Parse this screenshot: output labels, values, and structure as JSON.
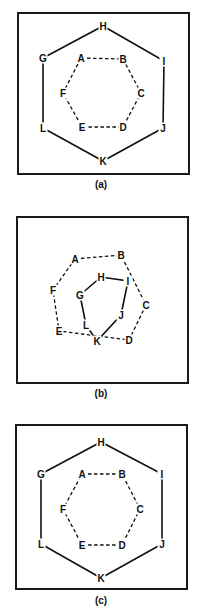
{
  "figure": {
    "panels": [
      {
        "id": "a",
        "caption": "(a)",
        "frame": {
          "x": 18,
          "y": 13,
          "w": 171,
          "h": 161
        },
        "caption_pos": {
          "x": 101,
          "y": 184
        },
        "inner_hexagon": {
          "style": "dashed",
          "vertices": [
            {
              "label": "A",
              "x": 81,
              "y": 58
            },
            {
              "label": "B",
              "x": 123,
              "y": 59
            },
            {
              "label": "C",
              "x": 141,
              "y": 93
            },
            {
              "label": "D",
              "x": 123,
              "y": 127
            },
            {
              "label": "E",
              "x": 82,
              "y": 127
            },
            {
              "label": "F",
              "x": 63,
              "y": 93
            }
          ]
        },
        "outer_hexagon": {
          "style": "solid",
          "vertices": [
            {
              "label": "G",
              "x": 43,
              "y": 58
            },
            {
              "label": "H",
              "x": 103,
              "y": 26
            },
            {
              "label": "I",
              "x": 164,
              "y": 61
            },
            {
              "label": "J",
              "x": 163,
              "y": 128
            },
            {
              "label": "K",
              "x": 103,
              "y": 161
            },
            {
              "label": "L",
              "x": 43,
              "y": 128
            }
          ]
        }
      },
      {
        "id": "b",
        "caption": "(b)",
        "frame": {
          "x": 17,
          "y": 217,
          "w": 171,
          "h": 166
        },
        "caption_pos": {
          "x": 101,
          "y": 393
        },
        "inner_hexagon": {
          "style": "dashed",
          "vertices": [
            {
              "label": "A",
              "x": 75,
              "y": 259
            },
            {
              "label": "B",
              "x": 121,
              "y": 255
            },
            {
              "label": "C",
              "x": 146,
              "y": 305
            },
            {
              "label": "D",
              "x": 129,
              "y": 340
            },
            {
              "label": "E",
              "x": 59,
              "y": 331
            },
            {
              "label": "F",
              "x": 53,
              "y": 290
            }
          ]
        },
        "outer_hexagon": {
          "style": "solid",
          "vertices": [
            {
              "label": "G",
              "x": 80,
              "y": 295
            },
            {
              "label": "H",
              "x": 101,
              "y": 277
            },
            {
              "label": "I",
              "x": 128,
              "y": 281
            },
            {
              "label": "J",
              "x": 121,
              "y": 315
            },
            {
              "label": "K",
              "x": 97,
              "y": 341
            },
            {
              "label": "L",
              "x": 86,
              "y": 325
            }
          ]
        }
      },
      {
        "id": "c",
        "caption": "(c)",
        "frame": {
          "x": 16,
          "y": 425,
          "w": 171,
          "h": 164
        },
        "caption_pos": {
          "x": 101,
          "y": 600
        },
        "inner_hexagon": {
          "style": "dashed",
          "vertices": [
            {
              "label": "A",
              "x": 82,
              "y": 474
            },
            {
              "label": "B",
              "x": 122,
              "y": 474
            },
            {
              "label": "C",
              "x": 140,
              "y": 509
            },
            {
              "label": "D",
              "x": 122,
              "y": 545
            },
            {
              "label": "E",
              "x": 82,
              "y": 545
            },
            {
              "label": "F",
              "x": 63,
              "y": 509
            }
          ]
        },
        "outer_hexagon": {
          "style": "solid",
          "vertices": [
            {
              "label": "G",
              "x": 41,
              "y": 474
            },
            {
              "label": "H",
              "x": 101,
              "y": 442
            },
            {
              "label": "I",
              "x": 162,
              "y": 474
            },
            {
              "label": "J",
              "x": 162,
              "y": 544
            },
            {
              "label": "K",
              "x": 101,
              "y": 578
            },
            {
              "label": "L",
              "x": 41,
              "y": 544
            }
          ]
        }
      }
    ]
  }
}
